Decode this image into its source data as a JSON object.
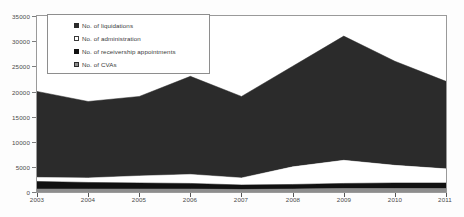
{
  "chart_data": {
    "type": "area",
    "stacked": true,
    "title": "",
    "xlabel": "",
    "ylabel": "",
    "x": [
      2003,
      2004,
      2005,
      2006,
      2007,
      2008,
      2009,
      2010,
      2011
    ],
    "categories": [
      "2003",
      "2004",
      "2005",
      "2006",
      "2007",
      "2008",
      "2009",
      "2010",
      "2011"
    ],
    "ylim": [
      0,
      35000
    ],
    "ytick_labels": [
      "0",
      "5000",
      "10000",
      "15000",
      "20000",
      "25000",
      "30000",
      "35000"
    ],
    "yticks": [
      0,
      5000,
      10000,
      15000,
      20000,
      25000,
      30000,
      35000
    ],
    "grid": false,
    "legend_position": "top-left",
    "series": [
      {
        "name": "No. of CVAs",
        "color": "#8d8d8d",
        "values": [
          600,
          600,
          600,
          600,
          500,
          600,
          700,
          700,
          700
        ]
      },
      {
        "name": "No. of receivership appointments",
        "color": "#111111",
        "values": [
          1500,
          1300,
          1200,
          1100,
          900,
          900,
          1000,
          1100,
          1100
        ]
      },
      {
        "name": "No. of administration",
        "color": "#ffffff",
        "values": [
          800,
          900,
          1400,
          1800,
          1400,
          3500,
          4600,
          3500,
          2800
        ]
      },
      {
        "name": "No. of liquidations",
        "color": "#2b2b2b",
        "values": [
          17100,
          15200,
          15800,
          19500,
          16200,
          20000,
          24700,
          20700,
          17400
        ]
      }
    ],
    "totals": [
      20000,
      18000,
      19000,
      23000,
      19000,
      25000,
      31000,
      26000,
      22000
    ]
  },
  "legend": {
    "items": [
      {
        "label": "No. of liquidations",
        "swatch": "liq"
      },
      {
        "label": "No. of administration",
        "swatch": "adm"
      },
      {
        "label": "No. of receivership appointments",
        "swatch": "rec"
      },
      {
        "label": "No. of CVAs",
        "swatch": "cva"
      }
    ]
  }
}
